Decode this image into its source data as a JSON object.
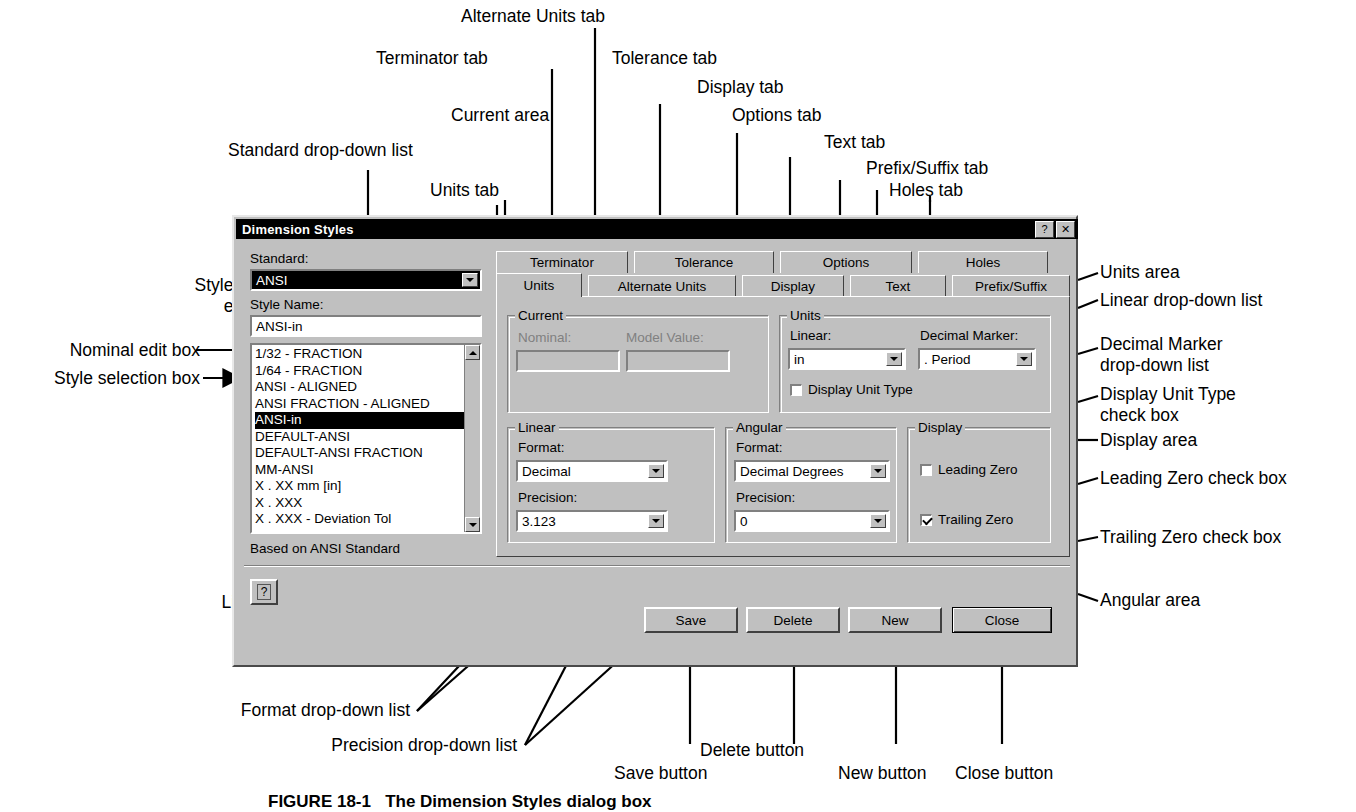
{
  "figure": {
    "caption": "FIGURE 18-1   The Dimension Styles dialog box"
  },
  "annotations": {
    "top": [
      {
        "text": "Alternate Units tab"
      },
      {
        "text": "Terminator tab"
      },
      {
        "text": "Tolerance tab"
      },
      {
        "text": "Display tab"
      },
      {
        "text": "Options tab"
      },
      {
        "text": "Current area"
      },
      {
        "text": "Text tab"
      },
      {
        "text": "Prefix/Suffix tab"
      },
      {
        "text": "Holes tab"
      },
      {
        "text": "Units tab"
      },
      {
        "text": "Standard drop-down list"
      }
    ],
    "left": [
      {
        "text": "Style Name"
      },
      {
        "text": "edit box"
      },
      {
        "text": "Nominal edit box"
      },
      {
        "text": "Style selection box"
      },
      {
        "text": "Linear area"
      },
      {
        "text": "Format drop-down list"
      },
      {
        "text": "Precision drop-down list"
      },
      {
        "text": "Save button"
      }
    ],
    "right": [
      {
        "text": "Units area"
      },
      {
        "text": "Linear drop-down list"
      },
      {
        "text": "Decimal Marker"
      },
      {
        "text": "drop-down list"
      },
      {
        "text": "Display Unit Type"
      },
      {
        "text": "check box"
      },
      {
        "text": "Display area"
      },
      {
        "text": "Leading Zero check box"
      },
      {
        "text": "Trailing Zero check box"
      },
      {
        "text": "Angular area"
      },
      {
        "text": "Close button"
      },
      {
        "text": "New button"
      },
      {
        "text": "Delete button"
      }
    ]
  },
  "dialog": {
    "title": "Dimension Styles",
    "titlebar_buttons": [
      {
        "name": "whats-this",
        "glyph": "?"
      },
      {
        "name": "close",
        "glyph": "✕"
      }
    ],
    "standard": {
      "label": "Standard:",
      "value": "ANSI"
    },
    "style_name": {
      "label": "Style Name:",
      "value": "ANSI-in"
    },
    "style_list": {
      "items": [
        "1/32 - FRACTION",
        "1/64 - FRACTION",
        "ANSI - ALIGNED",
        "ANSI FRACTION - ALIGNED",
        "ANSI-in",
        "DEFAULT-ANSI",
        "DEFAULT-ANSI FRACTION",
        "MM-ANSI",
        "X . XX mm [in]",
        "X . XXX",
        "X . XXX - Deviation Tol"
      ],
      "selected_index": 4
    },
    "based_on": "Based on ANSI Standard",
    "help_button": {
      "label": "?"
    },
    "tabs": {
      "row_top": [
        {
          "label": "Terminator",
          "selected": false
        },
        {
          "label": "Tolerance",
          "selected": false
        },
        {
          "label": "Options",
          "selected": false
        },
        {
          "label": "Holes",
          "selected": false
        }
      ],
      "row_bottom": [
        {
          "label": "Units",
          "selected": true
        },
        {
          "label": "Alternate Units",
          "selected": false
        },
        {
          "label": "Display",
          "selected": false
        },
        {
          "label": "Text",
          "selected": false
        },
        {
          "label": "Prefix/Suffix",
          "selected": false
        }
      ]
    },
    "current_group": {
      "title": "Current",
      "nominal": {
        "label": "Nominal:",
        "value": "",
        "disabled": true
      },
      "model_value": {
        "label": "Model Value:",
        "value": "",
        "disabled": true
      }
    },
    "units_group": {
      "title": "Units",
      "linear": {
        "label": "Linear:",
        "value": "in"
      },
      "decimal_marker": {
        "label": "Decimal Marker:",
        "value": ". Period"
      },
      "display_unit_type": {
        "label": "Display Unit Type",
        "checked": false
      }
    },
    "linear_group": {
      "title": "Linear",
      "format": {
        "label": "Format:",
        "value": "Decimal"
      },
      "precision": {
        "label": "Precision:",
        "value": "3.123"
      }
    },
    "angular_group": {
      "title": "Angular",
      "format": {
        "label": "Format:",
        "value": "Decimal Degrees"
      },
      "precision": {
        "label": "Precision:",
        "value": "0"
      }
    },
    "display_group": {
      "title": "Display",
      "leading_zero": {
        "label": "Leading Zero",
        "checked": false
      },
      "trailing_zero": {
        "label": "Trailing Zero",
        "checked": true
      }
    },
    "buttons": [
      {
        "label": "Save",
        "default": false
      },
      {
        "label": "Delete",
        "default": false
      },
      {
        "label": "New",
        "default": false
      },
      {
        "label": "Close",
        "default": true
      }
    ]
  }
}
